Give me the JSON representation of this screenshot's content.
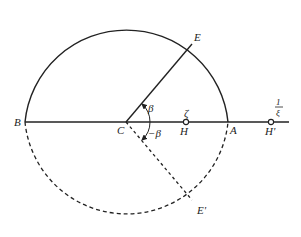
{
  "diagram": {
    "labels": {
      "B": "B",
      "C": "C",
      "A": "A",
      "E": "E",
      "E_prime": "E'",
      "H": "H",
      "H_prime": "H'",
      "zeta": "ζ",
      "beta": "β",
      "minus_beta": "−β",
      "one_over_xi_num": "1",
      "one_over_xi_den": "ξ"
    },
    "colors": {
      "stroke": "#222222",
      "background": "#ffffff"
    }
  }
}
